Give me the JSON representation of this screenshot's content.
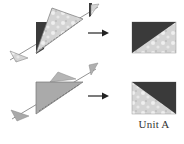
{
  "diagram": {
    "steps": [
      {
        "id": "step-1",
        "description": "Dark and light triangles sewn along diagonal, pressed and trimmed",
        "result": "dark upper-left, light lower-right"
      },
      {
        "id": "step-2",
        "description": "Medium triangles sewn along diagonal, pressed and trimmed",
        "result": "light lower-left, dark upper-right"
      }
    ],
    "label": "Unit A"
  },
  "colors": {
    "dark": "#3a3a3a",
    "light": "#d9d9d9",
    "light_pattern": "#eeeeee",
    "medium": "#a9a9a9",
    "medium_light": "#c4c4c4",
    "line": "#555555",
    "arrow": "#222222"
  }
}
